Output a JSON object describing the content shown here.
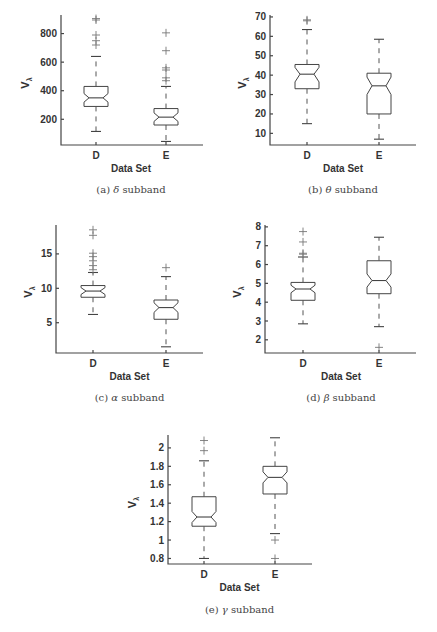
{
  "chart_data": [
    {
      "type": "boxplot",
      "panel": "a",
      "caption_label": "(a)",
      "caption_symbol": "δ",
      "caption_text": "subband",
      "xlabel": "Data Set",
      "ylabel": "V",
      "ylabel_sub": "λ",
      "categories": [
        "D",
        "E"
      ],
      "yticks": [
        200,
        400,
        600,
        800
      ],
      "ylim": [
        20,
        930
      ],
      "notched": true,
      "series": [
        {
          "name": "D",
          "whisker_low": 115,
          "q1": 290,
          "median": 350,
          "q3": 430,
          "whisker_high": 640,
          "notch_low": 320,
          "notch_high": 380,
          "outliers": [
            720,
            750,
            790,
            895,
            905
          ]
        },
        {
          "name": "E",
          "whisker_low": 45,
          "q1": 160,
          "median": 215,
          "q3": 275,
          "whisker_high": 430,
          "notch_low": 185,
          "notch_high": 245,
          "outliers": [
            470,
            490,
            545,
            560,
            680,
            805
          ]
        }
      ]
    },
    {
      "type": "boxplot",
      "panel": "b",
      "caption_label": "(b)",
      "caption_symbol": "θ",
      "caption_text": "subband",
      "xlabel": "Data Set",
      "ylabel": "V",
      "ylabel_sub": "λ",
      "categories": [
        "D",
        "E"
      ],
      "yticks": [
        10,
        20,
        30,
        40,
        50,
        60,
        70
      ],
      "ylim": [
        4,
        71
      ],
      "notched": true,
      "series": [
        {
          "name": "D",
          "whisker_low": 15,
          "q1": 33,
          "median": 40.5,
          "q3": 45.5,
          "whisker_high": 63.5,
          "notch_low": 36.5,
          "notch_high": 44,
          "outliers": [
            68,
            68.5
          ]
        },
        {
          "name": "E",
          "whisker_low": 7,
          "q1": 20,
          "median": 34.5,
          "q3": 41,
          "whisker_high": 58.5,
          "notch_low": 30,
          "notch_high": 39,
          "outliers": []
        }
      ]
    },
    {
      "type": "boxplot",
      "panel": "c",
      "caption_label": "(c)",
      "caption_symbol": "α",
      "caption_text": "subband",
      "xlabel": "Data Set",
      "ylabel": "V",
      "ylabel_sub": "λ",
      "categories": [
        "D",
        "E"
      ],
      "yticks": [
        5,
        10,
        15
      ],
      "ylim": [
        0.6,
        19.2
      ],
      "notched": true,
      "series": [
        {
          "name": "D",
          "whisker_low": 6.2,
          "q1": 8.7,
          "median": 9.6,
          "q3": 10.4,
          "whisker_high": 12.3,
          "notch_low": 9.1,
          "notch_high": 10.1,
          "outliers": [
            12.7,
            13.3,
            14.0,
            14.6,
            15.1,
            17.7,
            18.5
          ]
        },
        {
          "name": "E",
          "whisker_low": 1.5,
          "q1": 5.5,
          "median": 7.2,
          "q3": 8.3,
          "whisker_high": 11.7,
          "notch_low": 6.5,
          "notch_high": 7.9,
          "outliers": [
            13.0
          ]
        }
      ]
    },
    {
      "type": "boxplot",
      "panel": "d",
      "caption_label": "(d)",
      "caption_symbol": "β",
      "caption_text": "subband",
      "xlabel": "Data Set",
      "ylabel": "V",
      "ylabel_sub": "λ",
      "categories": [
        "D",
        "E"
      ],
      "yticks": [
        2,
        3,
        4,
        5,
        6,
        7,
        8
      ],
      "ylim": [
        1.3,
        8.1
      ],
      "notched": true,
      "series": [
        {
          "name": "D",
          "whisker_low": 2.85,
          "q1": 4.1,
          "median": 4.7,
          "q3": 5.05,
          "whisker_high": 6.4,
          "notch_low": 4.5,
          "notch_high": 4.9,
          "outliers": [
            6.55,
            6.6,
            7.2,
            7.75
          ]
        },
        {
          "name": "E",
          "whisker_low": 2.7,
          "q1": 4.45,
          "median": 5.15,
          "q3": 6.2,
          "whisker_high": 7.45,
          "notch_low": 4.8,
          "notch_high": 5.5,
          "outliers": [
            1.6
          ]
        }
      ]
    },
    {
      "type": "boxplot",
      "panel": "e",
      "caption_label": "(e)",
      "caption_symbol": "γ",
      "caption_text": "subband",
      "xlabel": "Data Set",
      "ylabel": "V",
      "ylabel_sub": "λ",
      "categories": [
        "D",
        "E"
      ],
      "yticks": [
        0.8,
        1,
        1.2,
        1.4,
        1.6,
        1.8,
        2
      ],
      "ylim": [
        0.74,
        2.14
      ],
      "notched": true,
      "series": [
        {
          "name": "D",
          "whisker_low": 0.8,
          "q1": 1.15,
          "median": 1.25,
          "q3": 1.47,
          "whisker_high": 1.86,
          "notch_low": 1.19,
          "notch_high": 1.31,
          "outliers": [
            1.97,
            2.08
          ]
        },
        {
          "name": "E",
          "whisker_low": 1.07,
          "q1": 1.5,
          "median": 1.68,
          "q3": 1.8,
          "whisker_high": 2.11,
          "notch_low": 1.62,
          "notch_high": 1.74,
          "outliers": [
            0.8,
            1.0
          ]
        }
      ]
    }
  ],
  "layout": {
    "panels": [
      {
        "x0": 61,
        "x1": 203,
        "ytop": 15,
        "ybot": 145,
        "catx": [
          96,
          166
        ],
        "cap_y": 193
      },
      {
        "x0": 270,
        "x1": 416,
        "ytop": 15,
        "ybot": 145,
        "catx": [
          307,
          379
        ],
        "cap_y": 193
      },
      {
        "x0": 56,
        "x1": 203,
        "ytop": 225,
        "ybot": 353,
        "catx": [
          93,
          166
        ],
        "cap_y": 401
      },
      {
        "x0": 265,
        "x1": 416,
        "ytop": 225,
        "ybot": 353,
        "catx": [
          303,
          379
        ],
        "cap_y": 401
      },
      {
        "x0": 168,
        "x1": 312,
        "ytop": 435,
        "ybot": 564,
        "catx": [
          204,
          275
        ],
        "cap_y": 613
      }
    ]
  }
}
